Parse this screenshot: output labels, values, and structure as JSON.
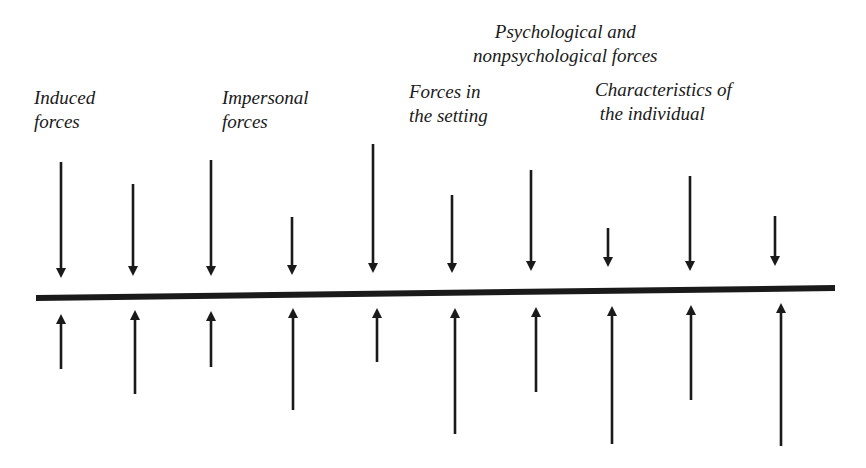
{
  "labels": {
    "induced": "Induced\nforces",
    "impersonal": "Impersonal\nforces",
    "setting": "Forces in\nthe setting",
    "psych": "Psychological and\nnonpsychological forces",
    "individual": "Characteristics of\n the individual"
  },
  "colors": {
    "ink": "#1a1a1a",
    "background": "#ffffff"
  },
  "baseline": {
    "x1": 36,
    "y1": 298,
    "x2": 835,
    "y2": 288,
    "width": 6
  },
  "down_arrows": [
    {
      "x": 61,
      "top": 162,
      "tip": 278
    },
    {
      "x": 133,
      "top": 184,
      "tip": 276
    },
    {
      "x": 211,
      "top": 160,
      "tip": 276
    },
    {
      "x": 292,
      "top": 217,
      "tip": 275
    },
    {
      "x": 373,
      "top": 144,
      "tip": 273
    },
    {
      "x": 452,
      "top": 195,
      "tip": 273
    },
    {
      "x": 531,
      "top": 170,
      "tip": 271
    },
    {
      "x": 608,
      "top": 228,
      "tip": 267
    },
    {
      "x": 690,
      "top": 176,
      "tip": 271
    },
    {
      "x": 775,
      "top": 216,
      "tip": 266
    }
  ],
  "up_arrows": [
    {
      "x": 61,
      "tip": 314,
      "bottom": 369
    },
    {
      "x": 135,
      "tip": 310,
      "bottom": 394
    },
    {
      "x": 211,
      "tip": 311,
      "bottom": 367
    },
    {
      "x": 293,
      "tip": 308,
      "bottom": 410
    },
    {
      "x": 377,
      "tip": 308,
      "bottom": 362
    },
    {
      "x": 455,
      "tip": 308,
      "bottom": 434
    },
    {
      "x": 536,
      "tip": 307,
      "bottom": 392
    },
    {
      "x": 612,
      "tip": 306,
      "bottom": 444
    },
    {
      "x": 691,
      "tip": 305,
      "bottom": 400
    },
    {
      "x": 781,
      "tip": 303,
      "bottom": 446
    }
  ]
}
